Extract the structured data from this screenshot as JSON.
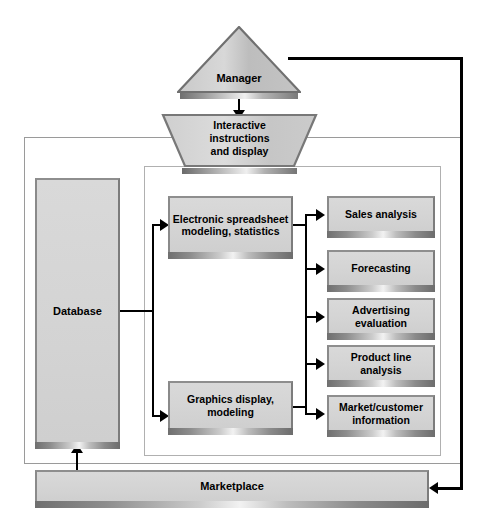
{
  "diagram": {
    "nodes": {
      "manager": "Manager",
      "interactive": "Interactive\ninstructions\nand display",
      "interactive_line1": "Interactive",
      "interactive_line2": "instructions",
      "interactive_line3": "and display",
      "database": "Database",
      "spreadsheet": "Electronic spreadsheet modeling, statistics",
      "graphics": "Graphics display, modeling",
      "marketplace": "Marketplace"
    },
    "outputs": [
      {
        "label": "Sales analysis"
      },
      {
        "label": "Forecasting"
      },
      {
        "label": "Advertising evaluation"
      },
      {
        "label": "Product line analysis"
      },
      {
        "label": "Market/customer information"
      }
    ],
    "colors": {
      "box_fill": "#d6d6d6",
      "box_border": "#7c7c7c",
      "frame_border": "#9a9a9a",
      "connector": "#000000",
      "background": "#ffffff"
    },
    "connections": [
      {
        "from": "Manager",
        "to": "Interactive instructions and display",
        "type": "bidirectional"
      },
      {
        "from": "Manager",
        "to": "Marketplace",
        "type": "arrow"
      },
      {
        "from": "Database",
        "to": "Electronic spreadsheet modeling, statistics",
        "type": "arrow"
      },
      {
        "from": "Database",
        "to": "Graphics display, modeling",
        "type": "arrow"
      },
      {
        "from": "Electronic spreadsheet modeling, statistics",
        "to": "outputs",
        "type": "arrow"
      },
      {
        "from": "Graphics display, modeling",
        "to": "outputs",
        "type": "arrow"
      },
      {
        "from": "Marketplace",
        "to": "Database",
        "type": "arrow"
      }
    ]
  }
}
